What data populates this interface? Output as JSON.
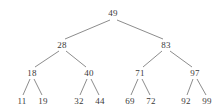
{
  "figure": {
    "type": "binary-search-tree-diagram",
    "background_color": "#ffffff",
    "edge_color": "#6e6e6e",
    "text_color": "#3a3a3a"
  },
  "chart_data": {
    "type": "diagram",
    "title": "",
    "xlabel": "",
    "ylabel": "",
    "structure": "binary-search-tree",
    "depth": 4,
    "node_count": 15,
    "root": "49",
    "levels": [
      [
        "49"
      ],
      [
        "28",
        "83"
      ],
      [
        "18",
        "40",
        "71",
        "97"
      ],
      [
        "11",
        "19",
        "32",
        "44",
        "69",
        "72",
        "92",
        "99"
      ]
    ],
    "inorder": [
      "11",
      "18",
      "19",
      "28",
      "32",
      "40",
      "44",
      "49",
      "69",
      "71",
      "72",
      "83",
      "92",
      "97",
      "99"
    ]
  },
  "nodes": [
    {
      "id": "n0",
      "label": "49",
      "x": 113,
      "y": 13,
      "level": 0
    },
    {
      "id": "n1",
      "label": "28",
      "x": 62,
      "y": 45,
      "level": 1
    },
    {
      "id": "n2",
      "label": "83",
      "x": 166,
      "y": 45,
      "level": 1
    },
    {
      "id": "n3",
      "label": "18",
      "x": 32,
      "y": 73,
      "level": 2
    },
    {
      "id": "n4",
      "label": "40",
      "x": 89,
      "y": 73,
      "level": 2
    },
    {
      "id": "n5",
      "label": "71",
      "x": 140,
      "y": 73,
      "level": 2
    },
    {
      "id": "n6",
      "label": "97",
      "x": 195,
      "y": 73,
      "level": 2
    },
    {
      "id": "n7",
      "label": "11",
      "x": 22,
      "y": 101,
      "level": 3
    },
    {
      "id": "n8",
      "label": "19",
      "x": 43,
      "y": 101,
      "level": 3
    },
    {
      "id": "n9",
      "label": "32",
      "x": 79,
      "y": 101,
      "level": 3
    },
    {
      "id": "n10",
      "label": "44",
      "x": 100,
      "y": 101,
      "level": 3
    },
    {
      "id": "n11",
      "label": "69",
      "x": 130,
      "y": 101,
      "level": 3
    },
    {
      "id": "n12",
      "label": "72",
      "x": 151,
      "y": 101,
      "level": 3
    },
    {
      "id": "n13",
      "label": "92",
      "x": 186,
      "y": 101,
      "level": 3
    },
    {
      "id": "n14",
      "label": "99",
      "x": 207,
      "y": 101,
      "level": 3
    }
  ],
  "edges": [
    {
      "id": "e0",
      "from": "49",
      "to": "28",
      "x1": 110,
      "y1": 20,
      "x2": 65,
      "y2": 39
    },
    {
      "id": "e1",
      "from": "49",
      "to": "83",
      "x1": 117,
      "y1": 20,
      "x2": 163,
      "y2": 39
    },
    {
      "id": "e2",
      "from": "28",
      "to": "18",
      "x1": 59,
      "y1": 51,
      "x2": 35,
      "y2": 67
    },
    {
      "id": "e3",
      "from": "28",
      "to": "40",
      "x1": 66,
      "y1": 51,
      "x2": 86,
      "y2": 67
    },
    {
      "id": "e4",
      "from": "83",
      "to": "71",
      "x1": 162,
      "y1": 51,
      "x2": 143,
      "y2": 67
    },
    {
      "id": "e5",
      "from": "83",
      "to": "97",
      "x1": 170,
      "y1": 51,
      "x2": 192,
      "y2": 67
    },
    {
      "id": "e6",
      "from": "18",
      "to": "11",
      "x1": 30,
      "y1": 79,
      "x2": 23,
      "y2": 95
    },
    {
      "id": "e7",
      "from": "18",
      "to": "19",
      "x1": 34,
      "y1": 79,
      "x2": 42,
      "y2": 95
    },
    {
      "id": "e8",
      "from": "40",
      "to": "32",
      "x1": 87,
      "y1": 79,
      "x2": 80,
      "y2": 95
    },
    {
      "id": "e9",
      "from": "40",
      "to": "44",
      "x1": 91,
      "y1": 79,
      "x2": 99,
      "y2": 95
    },
    {
      "id": "e10",
      "from": "71",
      "to": "69",
      "x1": 138,
      "y1": 79,
      "x2": 131,
      "y2": 95
    },
    {
      "id": "e11",
      "from": "71",
      "to": "72",
      "x1": 142,
      "y1": 79,
      "x2": 150,
      "y2": 95
    },
    {
      "id": "e12",
      "from": "97",
      "to": "92",
      "x1": 193,
      "y1": 79,
      "x2": 187,
      "y2": 95
    },
    {
      "id": "e13",
      "from": "97",
      "to": "99",
      "x1": 197,
      "y1": 79,
      "x2": 206,
      "y2": 95
    }
  ]
}
